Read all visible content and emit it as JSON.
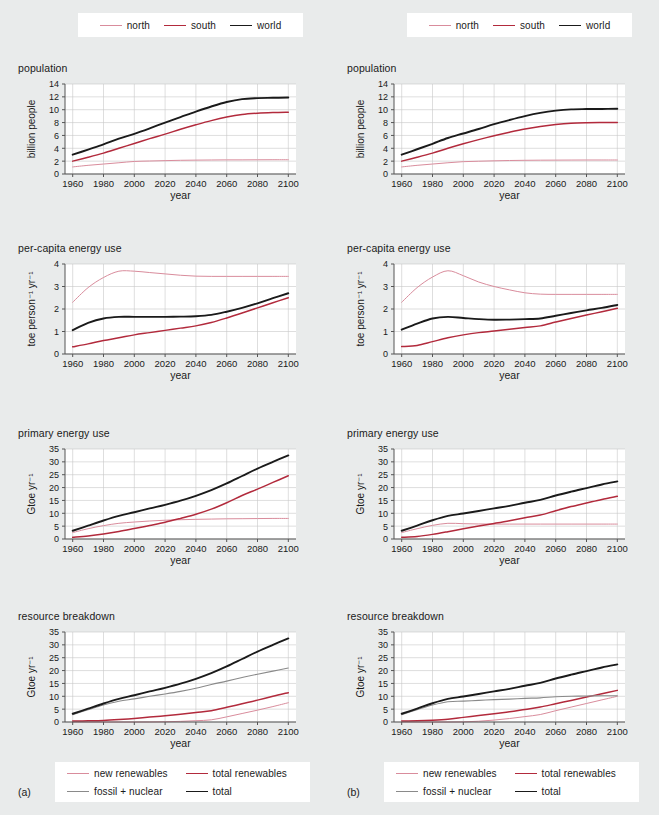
{
  "figure": {
    "panel_tags": {
      "a": "(a)",
      "b": "(b)"
    },
    "background_color": "#e9ebeb",
    "plot_background_color": "#ffffff",
    "colors": {
      "north": "#d98c9c",
      "south": "#b22a3c",
      "world": "#1a1a1a",
      "new_renewables": "#d98c9c",
      "total_renewables": "#b22a3c",
      "fossil_nuclear": "#8a8a8a",
      "total": "#1a1a1a",
      "grid": "#c8c8c8",
      "axis": "#555555"
    }
  },
  "legend_top": {
    "items": [
      {
        "label": "north",
        "color": "#d98c9c",
        "width": 1.1
      },
      {
        "label": "south",
        "color": "#b22a3c",
        "width": 1.6
      },
      {
        "label": "world",
        "color": "#1a1a1a",
        "width": 1.9
      }
    ]
  },
  "legend_bottom": {
    "items": [
      {
        "label": "new renewables",
        "color": "#d98c9c",
        "width": 1.1
      },
      {
        "label": "total renewables",
        "color": "#b22a3c",
        "width": 1.6
      },
      {
        "label": "fossil + nuclear",
        "color": "#8a8a8a",
        "width": 1.2
      },
      {
        "label": "total",
        "color": "#1a1a1a",
        "width": 1.9
      }
    ]
  },
  "axes_common": {
    "xlabel": "year",
    "xlim": [
      1955,
      2105
    ],
    "xticks": [
      1960,
      1980,
      2000,
      2020,
      2040,
      2060,
      2080,
      2100
    ],
    "xticklabels": [
      "1960",
      "1980",
      "2000",
      "2020",
      "2040",
      "2060",
      "2080",
      "2100"
    ]
  },
  "chart_data": [
    {
      "id": "a-population",
      "panel": "(a)",
      "type": "line",
      "title": "population",
      "xlabel": "year",
      "ylabel": "billion people",
      "ylim": [
        0,
        14
      ],
      "yticks": [
        0,
        2,
        4,
        6,
        8,
        10,
        12,
        14
      ],
      "yticklabels": [
        "0",
        "2",
        "4",
        "6",
        "8",
        "10",
        "12",
        "14"
      ],
      "grid": true,
      "x": [
        1960,
        1970,
        1980,
        1990,
        2000,
        2010,
        2020,
        2030,
        2040,
        2050,
        2060,
        2070,
        2080,
        2090,
        2100
      ],
      "series": [
        {
          "name": "north",
          "color": "#d98c9c",
          "values": [
            1.1,
            1.35,
            1.55,
            1.75,
            1.95,
            2.02,
            2.08,
            2.13,
            2.16,
            2.18,
            2.2,
            2.2,
            2.21,
            2.22,
            2.22
          ]
        },
        {
          "name": "south",
          "color": "#b22a3c",
          "values": [
            2.0,
            2.6,
            3.25,
            4.0,
            4.75,
            5.5,
            6.2,
            6.95,
            7.65,
            8.3,
            8.85,
            9.25,
            9.45,
            9.55,
            9.6
          ]
        },
        {
          "name": "world",
          "color": "#1a1a1a",
          "values": [
            3.0,
            3.8,
            4.6,
            5.5,
            6.25,
            7.1,
            8.0,
            8.85,
            9.7,
            10.5,
            11.2,
            11.65,
            11.8,
            11.85,
            11.9
          ]
        }
      ]
    },
    {
      "id": "a-per-capita",
      "panel": "(a)",
      "type": "line",
      "title": "per-capita energy use",
      "xlabel": "year",
      "ylabel": "toe person⁻¹ yr⁻¹",
      "ylim": [
        0,
        4
      ],
      "yticks": [
        0,
        1,
        2,
        3,
        4
      ],
      "yticklabels": [
        "0",
        "1",
        "2",
        "3",
        "4"
      ],
      "grid": true,
      "x": [
        1960,
        1970,
        1980,
        1990,
        2000,
        2010,
        2020,
        2030,
        2040,
        2050,
        2060,
        2070,
        2080,
        2090,
        2100
      ],
      "series": [
        {
          "name": "north",
          "color": "#d98c9c",
          "values": [
            2.3,
            2.95,
            3.4,
            3.68,
            3.68,
            3.62,
            3.56,
            3.5,
            3.46,
            3.45,
            3.45,
            3.45,
            3.45,
            3.45,
            3.45
          ]
        },
        {
          "name": "south",
          "color": "#b22a3c",
          "values": [
            0.32,
            0.45,
            0.6,
            0.72,
            0.85,
            0.95,
            1.05,
            1.15,
            1.25,
            1.4,
            1.6,
            1.82,
            2.05,
            2.28,
            2.5
          ]
        },
        {
          "name": "world",
          "color": "#1a1a1a",
          "values": [
            1.06,
            1.38,
            1.58,
            1.65,
            1.65,
            1.65,
            1.65,
            1.66,
            1.68,
            1.74,
            1.88,
            2.05,
            2.25,
            2.48,
            2.7
          ]
        }
      ]
    },
    {
      "id": "a-primary-energy",
      "panel": "(a)",
      "type": "line",
      "title": "primary energy use",
      "xlabel": "year",
      "ylabel": "Gtoe yr⁻¹",
      "ylim": [
        0,
        35
      ],
      "yticks": [
        0,
        5,
        10,
        15,
        20,
        25,
        30,
        35
      ],
      "yticklabels": [
        "0",
        "5",
        "10",
        "15",
        "20",
        "25",
        "30",
        "35"
      ],
      "grid": true,
      "x": [
        1960,
        1970,
        1980,
        1990,
        2000,
        2010,
        2020,
        2030,
        2040,
        2050,
        2060,
        2070,
        2080,
        2090,
        2100
      ],
      "series": [
        {
          "name": "north",
          "color": "#d98c9c",
          "values": [
            2.5,
            4.0,
            5.2,
            6.1,
            6.6,
            7.0,
            7.3,
            7.5,
            7.65,
            7.75,
            7.85,
            7.9,
            7.95,
            8.0,
            8.0
          ]
        },
        {
          "name": "south",
          "color": "#b22a3c",
          "values": [
            0.65,
            1.2,
            1.95,
            2.9,
            4.05,
            5.25,
            6.5,
            8.0,
            9.6,
            11.6,
            14.1,
            16.9,
            19.4,
            22.0,
            24.6
          ]
        },
        {
          "name": "world",
          "color": "#1a1a1a",
          "values": [
            3.2,
            5.2,
            7.2,
            9.0,
            10.4,
            11.9,
            13.3,
            14.9,
            16.8,
            19.0,
            21.6,
            24.5,
            27.4,
            30.0,
            32.5
          ]
        }
      ]
    },
    {
      "id": "a-resource-breakdown",
      "panel": "(a)",
      "type": "line",
      "title": "resource breakdown",
      "xlabel": "year",
      "ylabel": "Gtoe yr⁻¹",
      "ylim": [
        0,
        35
      ],
      "yticks": [
        0,
        5,
        10,
        15,
        20,
        25,
        30,
        35
      ],
      "yticklabels": [
        "0",
        "5",
        "10",
        "15",
        "20",
        "25",
        "30",
        "35"
      ],
      "grid": true,
      "x": [
        1960,
        1970,
        1980,
        1990,
        2000,
        2010,
        2020,
        2030,
        2040,
        2050,
        2060,
        2070,
        2080,
        2090,
        2100
      ],
      "series": [
        {
          "name": "new renewables",
          "color": "#d98c9c",
          "values": [
            0.0,
            0.0,
            0.0,
            0.0,
            0.0,
            0.02,
            0.1,
            0.25,
            0.5,
            0.85,
            2.0,
            3.3,
            4.6,
            6.0,
            7.5
          ]
        },
        {
          "name": "total renewables",
          "color": "#b22a3c",
          "values": [
            0.35,
            0.45,
            0.6,
            0.95,
            1.4,
            1.9,
            2.4,
            3.0,
            3.7,
            4.4,
            5.7,
            7.1,
            8.5,
            10.0,
            11.4
          ]
        },
        {
          "name": "fossil + nuclear",
          "color": "#8a8a8a",
          "values": [
            2.85,
            4.75,
            6.6,
            8.1,
            9.0,
            10.0,
            10.9,
            11.9,
            13.1,
            14.6,
            15.9,
            17.3,
            18.6,
            19.8,
            21.0
          ]
        },
        {
          "name": "total",
          "color": "#1a1a1a",
          "values": [
            3.2,
            5.2,
            7.2,
            9.0,
            10.4,
            11.9,
            13.3,
            14.9,
            16.8,
            19.0,
            21.6,
            24.5,
            27.4,
            30.0,
            32.5
          ]
        }
      ]
    },
    {
      "id": "b-population",
      "panel": "(b)",
      "type": "line",
      "title": "population",
      "xlabel": "year",
      "ylabel": "billion people",
      "ylim": [
        0,
        14
      ],
      "yticks": [
        0,
        2,
        4,
        6,
        8,
        10,
        12,
        14
      ],
      "yticklabels": [
        "0",
        "2",
        "4",
        "6",
        "8",
        "10",
        "12",
        "14"
      ],
      "grid": true,
      "x": [
        1960,
        1970,
        1980,
        1990,
        2000,
        2010,
        2020,
        2030,
        2040,
        2050,
        2060,
        2070,
        2080,
        2090,
        2100
      ],
      "series": [
        {
          "name": "north",
          "color": "#d98c9c",
          "values": [
            1.1,
            1.35,
            1.55,
            1.75,
            1.92,
            1.99,
            2.05,
            2.1,
            2.13,
            2.15,
            2.16,
            2.17,
            2.18,
            2.18,
            2.18
          ]
        },
        {
          "name": "south",
          "color": "#b22a3c",
          "values": [
            2.0,
            2.6,
            3.25,
            4.0,
            4.7,
            5.35,
            5.95,
            6.5,
            7.0,
            7.4,
            7.7,
            7.9,
            7.98,
            8.0,
            8.0
          ]
        },
        {
          "name": "world",
          "color": "#1a1a1a",
          "values": [
            3.0,
            3.85,
            4.7,
            5.6,
            6.3,
            7.0,
            7.75,
            8.4,
            9.0,
            9.5,
            9.85,
            10.05,
            10.1,
            10.12,
            10.15
          ]
        }
      ]
    },
    {
      "id": "b-per-capita",
      "panel": "(b)",
      "type": "line",
      "title": "per-capita energy use",
      "xlabel": "year",
      "ylabel": "toe person⁻¹ yr⁻¹",
      "ylim": [
        0,
        4
      ],
      "yticks": [
        0,
        1,
        2,
        3,
        4
      ],
      "yticklabels": [
        "0",
        "1",
        "2",
        "3",
        "4"
      ],
      "grid": true,
      "x": [
        1960,
        1970,
        1980,
        1990,
        2000,
        2010,
        2020,
        2030,
        2040,
        2050,
        2060,
        2070,
        2080,
        2090,
        2100
      ],
      "series": [
        {
          "name": "north",
          "color": "#d98c9c",
          "values": [
            2.3,
            2.95,
            3.42,
            3.7,
            3.48,
            3.2,
            3.0,
            2.85,
            2.72,
            2.66,
            2.65,
            2.65,
            2.65,
            2.65,
            2.65
          ]
        },
        {
          "name": "south",
          "color": "#b22a3c",
          "values": [
            0.33,
            0.38,
            0.55,
            0.72,
            0.85,
            0.95,
            1.02,
            1.1,
            1.18,
            1.25,
            1.42,
            1.58,
            1.73,
            1.88,
            2.03
          ]
        },
        {
          "name": "world",
          "color": "#1a1a1a",
          "values": [
            1.08,
            1.35,
            1.58,
            1.65,
            1.6,
            1.55,
            1.52,
            1.53,
            1.55,
            1.58,
            1.7,
            1.82,
            1.94,
            2.05,
            2.18
          ]
        }
      ]
    },
    {
      "id": "b-primary-energy",
      "panel": "(b)",
      "type": "line",
      "title": "primary energy use",
      "xlabel": "year",
      "ylabel": "Gtoe yr⁻¹",
      "ylim": [
        0,
        35
      ],
      "yticks": [
        0,
        5,
        10,
        15,
        20,
        25,
        30,
        35
      ],
      "yticklabels": [
        "0",
        "5",
        "10",
        "15",
        "20",
        "25",
        "30",
        "35"
      ],
      "grid": true,
      "x": [
        1960,
        1970,
        1980,
        1990,
        2000,
        2010,
        2020,
        2030,
        2040,
        2050,
        2060,
        2070,
        2080,
        2090,
        2100
      ],
      "series": [
        {
          "name": "north",
          "color": "#d98c9c",
          "values": [
            2.5,
            4.0,
            5.3,
            6.1,
            5.95,
            5.85,
            5.8,
            5.8,
            5.8,
            5.8,
            5.8,
            5.8,
            5.8,
            5.8,
            5.8
          ]
        },
        {
          "name": "south",
          "color": "#b22a3c",
          "values": [
            0.65,
            1.0,
            1.8,
            2.85,
            4.0,
            5.05,
            6.05,
            7.1,
            8.25,
            9.3,
            11.0,
            12.6,
            14.0,
            15.4,
            16.6
          ]
        },
        {
          "name": "world",
          "color": "#1a1a1a",
          "values": [
            3.2,
            5.2,
            7.3,
            9.0,
            9.9,
            10.9,
            11.9,
            12.9,
            14.1,
            15.2,
            16.9,
            18.4,
            19.8,
            21.2,
            22.4
          ]
        }
      ]
    },
    {
      "id": "b-resource-breakdown",
      "panel": "(b)",
      "type": "line",
      "title": "resource breakdown",
      "xlabel": "year",
      "ylabel": "Gtoe yr⁻¹",
      "ylim": [
        0,
        35
      ],
      "yticks": [
        0,
        5,
        10,
        15,
        20,
        25,
        30,
        35
      ],
      "yticklabels": [
        "0",
        "5",
        "10",
        "15",
        "20",
        "25",
        "30",
        "35"
      ],
      "grid": true,
      "x": [
        1960,
        1970,
        1980,
        1990,
        2000,
        2010,
        2020,
        2030,
        2040,
        2050,
        2060,
        2070,
        2080,
        2090,
        2100
      ],
      "series": [
        {
          "name": "new renewables",
          "color": "#d98c9c",
          "values": [
            0.0,
            0.0,
            0.0,
            0.0,
            0.05,
            0.3,
            0.75,
            1.35,
            2.1,
            2.9,
            4.4,
            5.8,
            7.2,
            8.6,
            10.0
          ]
        },
        {
          "name": "total renewables",
          "color": "#b22a3c",
          "values": [
            0.35,
            0.45,
            0.7,
            1.1,
            1.8,
            2.5,
            3.2,
            4.0,
            4.9,
            5.8,
            7.1,
            8.4,
            9.7,
            11.0,
            12.3
          ]
        },
        {
          "name": "fossil + nuclear",
          "color": "#8a8a8a",
          "values": [
            2.85,
            4.75,
            6.6,
            7.9,
            8.1,
            8.4,
            8.7,
            8.9,
            9.2,
            9.4,
            9.8,
            10.0,
            10.1,
            10.2,
            10.2
          ]
        },
        {
          "name": "total",
          "color": "#1a1a1a",
          "values": [
            3.2,
            5.2,
            7.3,
            9.0,
            9.9,
            10.9,
            11.9,
            12.9,
            14.1,
            15.2,
            16.9,
            18.4,
            19.8,
            21.2,
            22.4
          ]
        }
      ]
    }
  ]
}
